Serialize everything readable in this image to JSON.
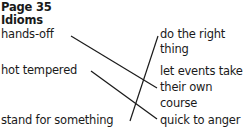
{
  "header": {
    "page": "Page 35",
    "title": "Idioms"
  },
  "left_items": [
    {
      "label": "hands-off"
    },
    {
      "label": "hot tempered"
    },
    {
      "label": "stand for something"
    }
  ],
  "right_items": [
    {
      "lines": [
        "do the right",
        "thing"
      ]
    },
    {
      "lines": [
        "let events take",
        "their own",
        "course"
      ]
    },
    {
      "lines": [
        "quick to anger"
      ]
    }
  ],
  "matches": [
    {
      "from": "hands-off",
      "to": "let events take their own course"
    },
    {
      "from": "hot tempered",
      "to": "quick to anger"
    },
    {
      "from": "stand for something",
      "to": "do the right thing"
    }
  ]
}
